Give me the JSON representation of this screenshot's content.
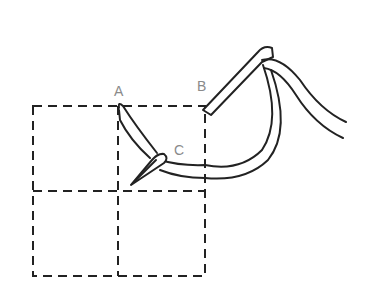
{
  "diagram": {
    "type": "stitch-illustration",
    "labels": [
      {
        "id": "A",
        "text": "A"
      },
      {
        "id": "B",
        "text": "B"
      },
      {
        "id": "C",
        "text": "C"
      }
    ],
    "colors": {
      "line": "#222222",
      "label": "#8a8a8a",
      "background": "#ffffff"
    }
  }
}
